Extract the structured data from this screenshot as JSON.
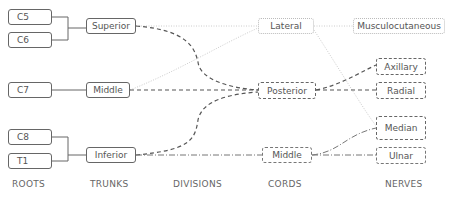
{
  "columns": [
    {
      "label": "ROOTS",
      "x": 12
    },
    {
      "label": "TRUNKS",
      "x": 90
    },
    {
      "label": "DIVISIONS",
      "x": 173
    },
    {
      "label": "CORDS",
      "x": 268
    },
    {
      "label": "NERVES",
      "x": 385
    }
  ],
  "roots": {
    "c5": "C5",
    "c6": "C6",
    "c7": "C7",
    "c8": "C8",
    "t1": "T1"
  },
  "trunks": {
    "superior": "Superior",
    "middle": "Middle",
    "inferior": "Inferior"
  },
  "cords": {
    "lateral": "Lateral",
    "posterior": "Posterior",
    "medial": "Middle"
  },
  "nerves": {
    "musculocutaneous": "Musculocutaneous",
    "axillary": "Axillary",
    "radial": "Radial",
    "median": "Median",
    "ulnar": "Ulnar"
  },
  "edges": [
    {
      "from": "C5",
      "to": "Superior",
      "style": "solid"
    },
    {
      "from": "C6",
      "to": "Superior",
      "style": "solid"
    },
    {
      "from": "C7",
      "to": "Middle",
      "style": "solid"
    },
    {
      "from": "C8",
      "to": "Inferior",
      "style": "solid"
    },
    {
      "from": "T1",
      "to": "Inferior",
      "style": "solid"
    },
    {
      "from": "Superior",
      "to": "Lateral",
      "style": "dotted"
    },
    {
      "from": "Middle",
      "to": "Lateral",
      "style": "dotted"
    },
    {
      "from": "Superior",
      "to": "Posterior",
      "style": "dashed"
    },
    {
      "from": "Middle",
      "to": "Posterior",
      "style": "dashed"
    },
    {
      "from": "Inferior",
      "to": "Posterior",
      "style": "dashed"
    },
    {
      "from": "Inferior",
      "to": "Middle (cord)",
      "style": "dash-dot"
    },
    {
      "from": "Lateral",
      "to": "Musculocutaneous",
      "style": "dotted"
    },
    {
      "from": "Lateral",
      "to": "Median",
      "style": "dotted"
    },
    {
      "from": "Posterior",
      "to": "Axillary",
      "style": "dashed"
    },
    {
      "from": "Posterior",
      "to": "Radial",
      "style": "dashed"
    },
    {
      "from": "Middle (cord)",
      "to": "Median",
      "style": "dash-dot"
    },
    {
      "from": "Middle (cord)",
      "to": "Ulnar",
      "style": "dash-dot"
    }
  ]
}
